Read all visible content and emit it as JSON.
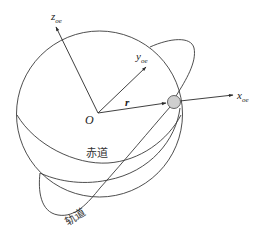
{
  "diagram": {
    "type": "orbital-reference-frame",
    "origin": {
      "label": "O"
    },
    "axes": {
      "z": {
        "label_main": "z",
        "label_sub": "oe"
      },
      "y": {
        "label_main": "y",
        "label_sub": "oe"
      },
      "x": {
        "label_main": "x",
        "label_sub": "oe"
      }
    },
    "position_vector": {
      "label": "r"
    },
    "curves": {
      "equator": {
        "label": "赤道"
      },
      "orbit": {
        "label": "轨道"
      }
    },
    "satellite": {
      "fill": "#cfcfcf",
      "stroke": "#555555"
    },
    "colors": {
      "line": "#3a3a3a",
      "text": "#222222"
    }
  }
}
